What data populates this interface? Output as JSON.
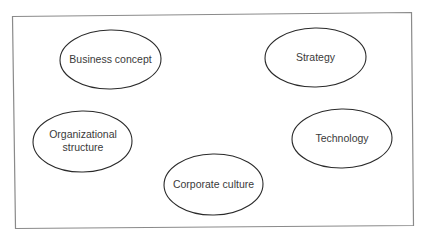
{
  "diagram": {
    "colors": {
      "frame_stroke": "#8a8a8a",
      "ellipse_stroke": "#2a2a2a",
      "text": "#3a3a3a",
      "background": "#ffffff"
    },
    "nodes": [
      {
        "id": "business-concept",
        "lines": [
          "Business concept"
        ]
      },
      {
        "id": "strategy",
        "lines": [
          "Strategy"
        ]
      },
      {
        "id": "organizational-structure",
        "lines": [
          "Organizational",
          "structure"
        ]
      },
      {
        "id": "technology",
        "lines": [
          "Technology"
        ]
      },
      {
        "id": "corporate-culture",
        "lines": [
          "Corporate culture"
        ]
      }
    ]
  }
}
